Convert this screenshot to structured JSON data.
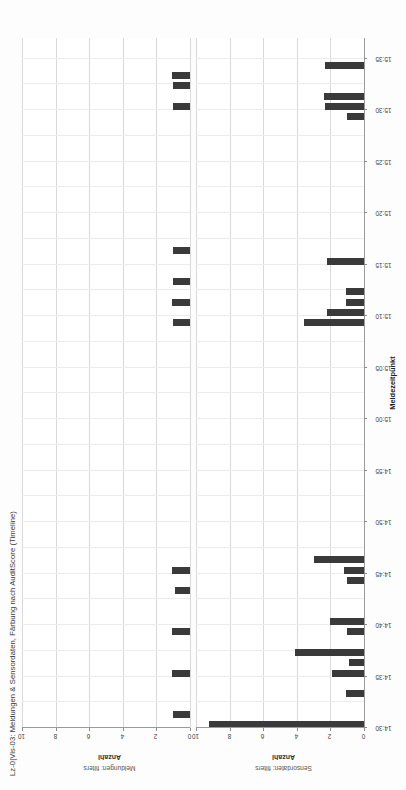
{
  "chart_data": {
    "type": "bar",
    "orientation": "horizontal",
    "title": "Lz-0|Vis-03: Meldungen & Sensordaten, Färbung nach AuditScore (Timeline)",
    "xlabel": "Meldezeitpunkt",
    "ylabel": "Anzahl",
    "ylim": [
      0,
      10
    ],
    "yticks": [
      "0",
      "2",
      "4",
      "6",
      "8",
      "10"
    ],
    "ytick_values": [
      0,
      2,
      4,
      6,
      8,
      10
    ],
    "xticks": [
      "14:30",
      "14:35",
      "14:40",
      "14:45",
      "14:50",
      "14:55",
      "15:00",
      "15:05",
      "15:10",
      "15:15",
      "15:20",
      "15:25",
      "15:30",
      "15:35"
    ],
    "grid": true,
    "legend": "none",
    "colorby": "AuditScore",
    "bar_color": "#3a3a3a",
    "panels": [
      {
        "facet_label": "Meldungen: filters",
        "axis_label": "Anzahl",
        "values": [
          {
            "time": "14:31",
            "value": 1.0
          },
          {
            "time": "14:35",
            "value": 1.1
          },
          {
            "time": "14:39",
            "value": 1.1
          },
          {
            "time": "14:43",
            "value": 0.9
          },
          {
            "time": "14:45",
            "value": 1.1
          },
          {
            "time": "15:09",
            "value": 1.0
          },
          {
            "time": "15:11",
            "value": 1.1
          },
          {
            "time": "15:13",
            "value": 1.0
          },
          {
            "time": "15:16",
            "value": 1.0
          },
          {
            "time": "15:30",
            "value": 1.0
          },
          {
            "time": "15:32",
            "value": 1.0
          },
          {
            "time": "15:33",
            "value": 1.1
          }
        ]
      },
      {
        "facet_label": "Sensordaten: filters",
        "axis_label": "Anzahl",
        "values": [
          {
            "time": "14:30",
            "value": 9.2
          },
          {
            "time": "14:33",
            "value": 1.1
          },
          {
            "time": "14:35",
            "value": 1.9
          },
          {
            "time": "14:36",
            "value": 0.9
          },
          {
            "time": "14:37",
            "value": 4.1
          },
          {
            "time": "14:39",
            "value": 1.0
          },
          {
            "time": "14:40",
            "value": 2.0
          },
          {
            "time": "14:44",
            "value": 1.0
          },
          {
            "time": "14:45",
            "value": 1.2
          },
          {
            "time": "14:46",
            "value": 3.0
          },
          {
            "time": "15:09",
            "value": 3.6
          },
          {
            "time": "15:10",
            "value": 2.2
          },
          {
            "time": "15:11",
            "value": 1.1
          },
          {
            "time": "15:12",
            "value": 1.1
          },
          {
            "time": "15:15",
            "value": 2.2
          },
          {
            "time": "15:29",
            "value": 1.0
          },
          {
            "time": "15:30",
            "value": 2.3
          },
          {
            "time": "15:31",
            "value": 2.4
          },
          {
            "time": "15:34",
            "value": 2.3
          }
        ]
      }
    ]
  },
  "overlay": {
    "corner_badge": "‹",
    "pen_mark": "pen-stroke"
  }
}
